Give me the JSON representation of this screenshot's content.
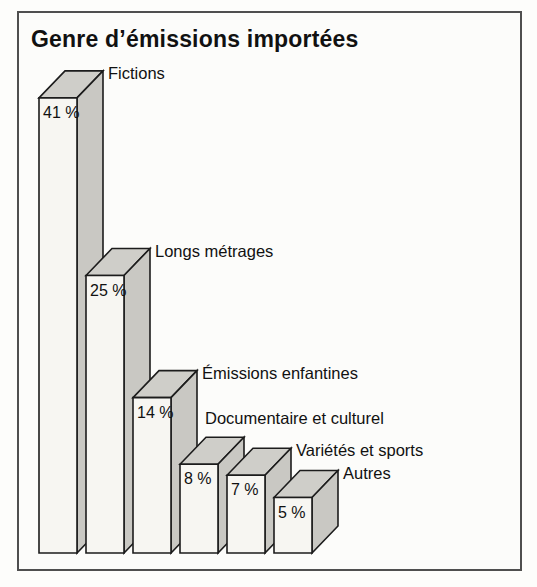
{
  "title": "Genre d’émissions importées",
  "chart_data": {
    "type": "bar",
    "style": "3d-extruded-bars",
    "title": "Genre d’émissions importées",
    "categories": [
      "Fictions",
      "Longs métrages",
      "Émissions enfantines",
      "Documentaire et culturel",
      "Variétés et sports",
      "Autres"
    ],
    "values": [
      41,
      25,
      14,
      8,
      7,
      5
    ],
    "value_labels": [
      "41 %",
      "25 %",
      "14 %",
      "8 %",
      "7 %",
      "5 %"
    ],
    "unit": "%",
    "xlabel": "",
    "ylabel": "",
    "ylim": [
      0,
      45
    ],
    "grid": false,
    "legend": "none",
    "axes_shown": false,
    "label_placement": "value inside front face near top, category name beside top-right apex (Documentaire et culturel placed above its bar)"
  },
  "colors": {
    "front_face": "#f7f6f2",
    "top_face": "#cfcec9",
    "side_face": "#c9c8c3",
    "outline": "#1c1c1c",
    "text": "#111111",
    "frame_border": "#4f4f4f",
    "background": "#fcfcfa"
  }
}
